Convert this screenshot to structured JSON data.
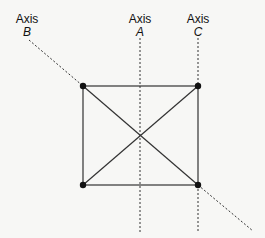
{
  "diagram": {
    "axes": [
      {
        "id": "B",
        "word": "Axis",
        "name": "B"
      },
      {
        "id": "A",
        "word": "Axis",
        "name": "A"
      },
      {
        "id": "C",
        "word": "Axis",
        "name": "C"
      }
    ],
    "shape": "square with diagonals",
    "vertices": 4,
    "colors": {
      "line": "#333333",
      "dot": "#111111",
      "background": "#f7f7f5"
    }
  }
}
